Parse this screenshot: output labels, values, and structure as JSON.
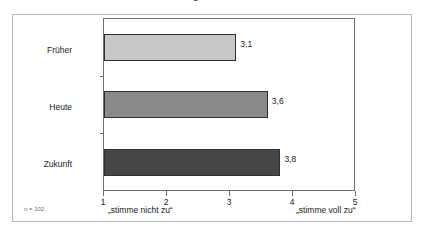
{
  "figure": {
    "title_fragment": "Einschätzung",
    "sample_note": "n = 102"
  },
  "chart_data": {
    "type": "bar",
    "orientation": "horizontal",
    "title": "",
    "categories": [
      "Früher",
      "Heute",
      "Zukunft"
    ],
    "values": [
      3.1,
      3.6,
      3.8
    ],
    "value_labels": [
      "3,1",
      "3,6",
      "3,8"
    ],
    "series": [
      {
        "name": "Mittelwert",
        "values": [
          3.1,
          3.6,
          3.8
        ]
      }
    ],
    "bar_colors": [
      "#c8c8c8",
      "#8a8a8a",
      "#464646"
    ],
    "bar_border_color": "#2e2e2e",
    "xlabel": "",
    "ylabel": "",
    "xlim": [
      1,
      5
    ],
    "xticks": [
      1,
      2,
      3,
      4,
      5
    ],
    "xtick_labels": [
      "1",
      "2",
      "3",
      "4",
      "5"
    ],
    "grid": false,
    "legend": false,
    "annotations": {
      "scale_low": "„stimme nicht zu“",
      "scale_high": "„stimme voll zu“",
      "sample_size": "n = 102"
    }
  }
}
